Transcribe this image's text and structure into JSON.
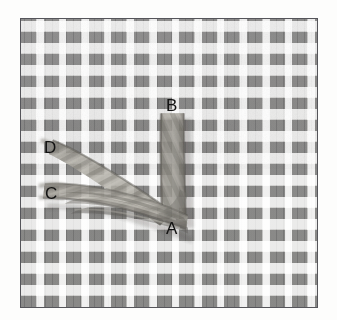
{
  "figure": {
    "name": "rope-knot-on-canvas-photograph",
    "frame": {
      "border_color": "#55555a",
      "x": 20,
      "y": 18,
      "width": 298,
      "height": 290
    },
    "canvas": {
      "background_color": "#f4f3f0",
      "tuft_color": "#b7b7b8",
      "grid_columns": 13,
      "grid_rows": 13,
      "cell_width": 22.6,
      "cell_height": 22.0
    },
    "rope": {
      "color_light": "#b9b6ae",
      "color_mid": "#8d8a83",
      "color_dark": "#5f5c57",
      "segments": [
        {
          "id": "vertical",
          "from": "B",
          "to": "A",
          "x": 170,
          "y_top": 113,
          "y_bottom": 216,
          "width": 22
        },
        {
          "id": "diagonal",
          "from": "D",
          "to": "knot",
          "x_start": 60,
          "y_start": 150,
          "x_end": 168,
          "y_end": 212,
          "width": 18
        },
        {
          "id": "horizontal",
          "from": "C",
          "to": "knot",
          "x_start": 58,
          "y_start": 192,
          "x_end": 172,
          "y_end": 205,
          "width": 20
        }
      ]
    },
    "labels": [
      {
        "id": "label-b",
        "text": "B",
        "x": 165,
        "y": 96,
        "color": "#121212"
      },
      {
        "id": "label-d",
        "text": "D",
        "x": 43,
        "y": 138,
        "color": "#121212"
      },
      {
        "id": "label-c",
        "text": "C",
        "x": 44,
        "y": 184,
        "color": "#121212"
      },
      {
        "id": "label-a",
        "text": "A",
        "x": 165,
        "y": 219,
        "color": "#121212"
      }
    ]
  }
}
